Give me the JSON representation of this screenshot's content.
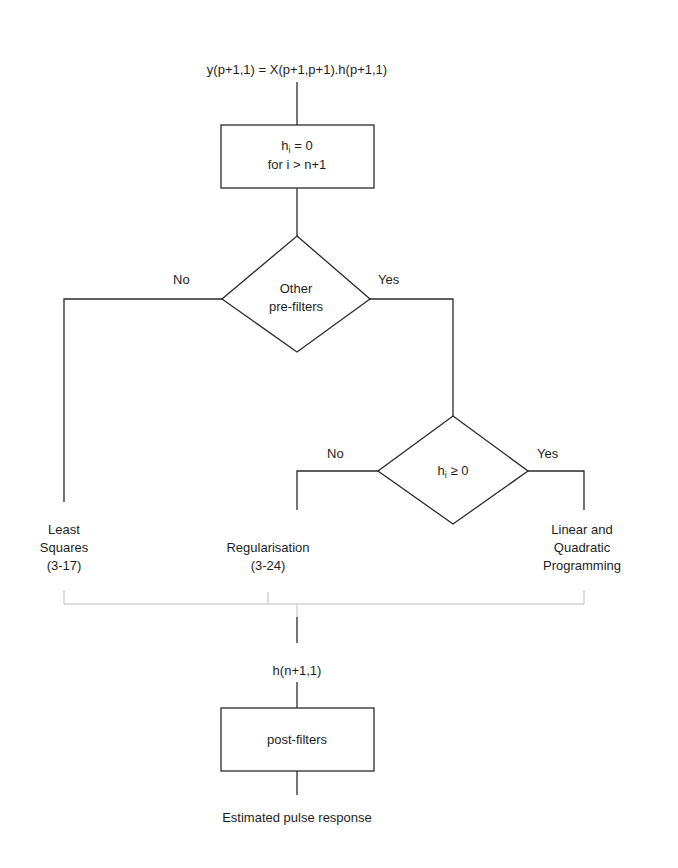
{
  "diagram": {
    "type": "flowchart",
    "input_equation": "y(p+1,1) = X(p+1,p+1).h(p+1,1)",
    "constraint_box": {
      "line1_var": "h",
      "line1_sub": "i",
      "line1_rest": " = 0",
      "line2": "for i > n+1"
    },
    "decision1": {
      "line1": "Other",
      "line2": "pre-filters",
      "no_label": "No",
      "yes_label": "Yes"
    },
    "decision2": {
      "var": "h",
      "sub": "i",
      "rest": " ≥ 0",
      "no_label": "No",
      "yes_label": "Yes"
    },
    "methods": {
      "least_squares": {
        "line1": "Least",
        "line2": "Squares",
        "line3": "(3-17)"
      },
      "regularisation": {
        "line1": "Regularisation",
        "line2": "(3-24)"
      },
      "lp_qp": {
        "line1": "Linear and",
        "line2": "Quadratic",
        "line3": "Programming"
      }
    },
    "merged_output": "h(n+1,1)",
    "post_box": "post-filters",
    "final_output": "Estimated pulse response",
    "colors": {
      "line": "#2a2a2a",
      "merge_line": "#bdbdbd",
      "background": "#ffffff"
    }
  }
}
